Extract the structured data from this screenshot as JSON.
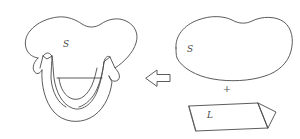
{
  "figure": {
    "background_color": "#ffffff",
    "stroke_color": "#4a4a4a",
    "left_side": {
      "name": "surface-with-handle",
      "label": "S",
      "description": "blob surface with U-shaped tube handle hanging below"
    },
    "operator_arrow": {
      "name": "leftwards-block-arrow",
      "direction": "left",
      "glyph": "left-arrow-icon"
    },
    "right_side": {
      "surface": {
        "name": "plain-surface-blob",
        "label": "S"
      },
      "plus_sign": "+",
      "handle": {
        "name": "one-handle-parallelogram",
        "label": "L"
      }
    }
  }
}
